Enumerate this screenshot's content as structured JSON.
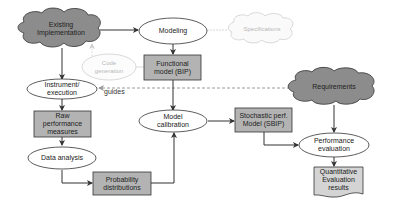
{
  "diagram": {
    "colors": {
      "cloud_fill": "#8c8c8c",
      "box_fill": "#b3b3b3",
      "doc_fill": "#d4d4d4",
      "stroke": "#333333",
      "faded_stroke": "#cfcfcf",
      "faded_text": "#b8b8b8",
      "dashed_edge": "#9a9a9a"
    },
    "nodes": {
      "existing_implementation": {
        "label": "Existing\nImplementation",
        "shape": "cloud"
      },
      "modeling": {
        "label": "Modeling",
        "shape": "ellipse"
      },
      "specifications": {
        "label": "Specifications",
        "shape": "cloud",
        "faded": true
      },
      "code_generation": {
        "label": "Code\ngeneration",
        "shape": "ellipse",
        "faded": true
      },
      "functional_model": {
        "label": "Functional\nmodel (BIP)",
        "shape": "box"
      },
      "instrument_execution": {
        "label": "Instrument/\nexecution",
        "shape": "ellipse"
      },
      "requirements": {
        "label": "Requirements",
        "shape": "cloud"
      },
      "raw_performance_measures": {
        "label": "Raw\nperformance\nmeasures",
        "shape": "box"
      },
      "model_calibration": {
        "label": "Model\ncalibration",
        "shape": "ellipse"
      },
      "stochastic_model": {
        "label": "Stochastic perf.\nModel (SBIP)",
        "shape": "box"
      },
      "performance_evaluation": {
        "label": "Performance\nevaluation",
        "shape": "ellipse"
      },
      "data_analysis": {
        "label": "Data analysis",
        "shape": "ellipse"
      },
      "probability_distributions": {
        "label": "Probability\ndistributions",
        "shape": "box"
      },
      "quantitative_results": {
        "label": "Quantitative\nEvaluation\nresults",
        "shape": "document"
      }
    },
    "edges": [
      {
        "from": "existing_implementation",
        "to": "modeling"
      },
      {
        "from": "existing_implementation",
        "to": "instrument_execution"
      },
      {
        "from": "modeling",
        "to": "functional_model"
      },
      {
        "from": "modeling",
        "to": "specifications",
        "style": "faded"
      },
      {
        "from": "code_generation",
        "to": "existing_implementation",
        "style": "faded"
      },
      {
        "from": "functional_model",
        "to": "code_generation",
        "style": "faded"
      },
      {
        "from": "requirements",
        "to": "instrument_execution",
        "style": "dashed",
        "label": "guides"
      },
      {
        "from": "instrument_execution",
        "to": "raw_performance_measures"
      },
      {
        "from": "raw_performance_measures",
        "to": "data_analysis"
      },
      {
        "from": "data_analysis",
        "to": "probability_distributions"
      },
      {
        "from": "probability_distributions",
        "to": "model_calibration"
      },
      {
        "from": "functional_model",
        "to": "model_calibration"
      },
      {
        "from": "model_calibration",
        "to": "stochastic_model"
      },
      {
        "from": "stochastic_model",
        "to": "performance_evaluation"
      },
      {
        "from": "requirements",
        "to": "performance_evaluation"
      },
      {
        "from": "performance_evaluation",
        "to": "quantitative_results"
      }
    ],
    "edge_labels": {
      "guides": "guides"
    }
  }
}
